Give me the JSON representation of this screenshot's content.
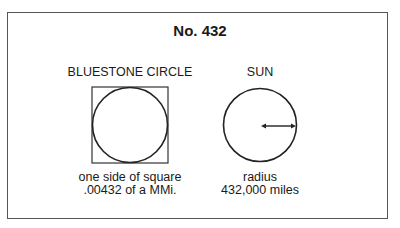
{
  "title": "No. 432",
  "left": {
    "heading": "BLUESTONE CIRCLE",
    "caption_line1": "one side of square",
    "caption_line2": ".00432 of a MMi."
  },
  "right": {
    "heading": "SUN",
    "caption_line1": "radius",
    "caption_line2": "432,000 miles"
  },
  "colors": {
    "line": "#222222",
    "frame": "#555555"
  }
}
